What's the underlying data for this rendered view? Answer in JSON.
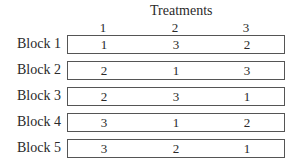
{
  "title": "Treatments",
  "columns": [
    "1",
    "2",
    "3"
  ],
  "rows": [
    {
      "label": "Block 1",
      "values": [
        "1",
        "3",
        "2"
      ]
    },
    {
      "label": "Block 2",
      "values": [
        "2",
        "1",
        "3"
      ]
    },
    {
      "label": "Block 3",
      "values": [
        "2",
        "3",
        "1"
      ]
    },
    {
      "label": "Block 4",
      "values": [
        "3",
        "1",
        "2"
      ]
    },
    {
      "label": "Block 5",
      "values": [
        "3",
        "2",
        "1"
      ]
    }
  ]
}
